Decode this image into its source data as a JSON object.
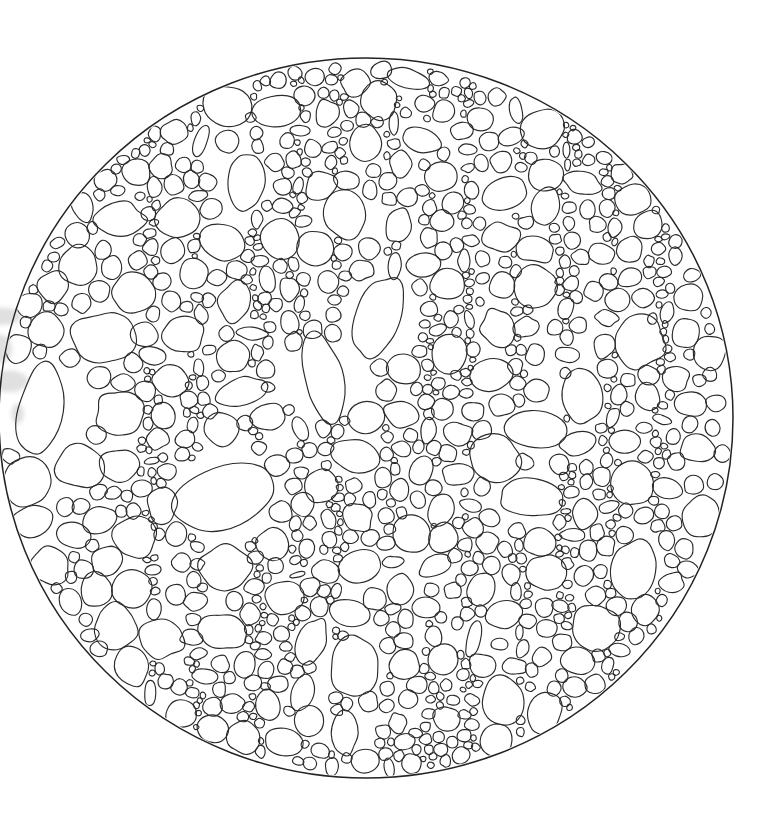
{
  "document": {
    "type": "scientific-line-drawing",
    "subject": "Plant stem transverse section — cellular anatomy",
    "medium": "ink line drawing on white paper (scanned)",
    "title": "",
    "caption": "",
    "labels": [],
    "annotations": [],
    "scale_bar": null
  },
  "canvas": {
    "width": 761,
    "height": 832,
    "background_color": "#ffffff"
  },
  "style": {
    "line_color": "#2b2b2b",
    "outline_color": "#232323",
    "cell_fill": "none",
    "line_width": 1.15,
    "outline_width": 1.5
  },
  "specimen": {
    "outline_shape": "ellipse",
    "center_x": 366,
    "center_y": 418,
    "radius_x": 367,
    "radius_y": 360,
    "cropped_at_left_edge": true,
    "edge_artifact": {
      "name": "scan-smudge",
      "x": 0,
      "y": 300,
      "width": 26,
      "height": 130,
      "color": "#9a9a9a"
    }
  },
  "structure": {
    "description": "Irregular rounded cells of varying size filling an elliptical cross-section; narrow vertical columns of small cells (rays) alternate with zones of larger parenchyma cells.",
    "ray_columns_x": [
      150,
      196,
      258,
      298,
      336,
      392,
      432,
      468,
      520,
      566,
      612,
      660
    ],
    "large_cell_zones_x": [
      110,
      225,
      360,
      500,
      640
    ],
    "cell_size_range_px": [
      5,
      62
    ],
    "approx_cell_count": 1450
  },
  "seed": 20240517
}
